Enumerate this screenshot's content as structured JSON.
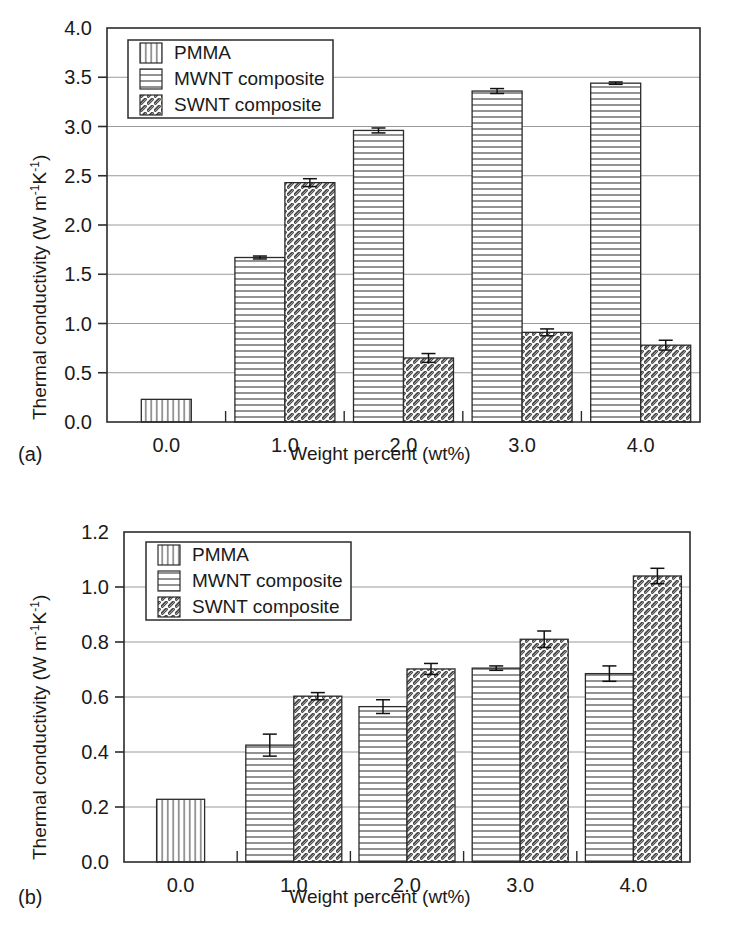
{
  "figure": {
    "panels": [
      {
        "panel_label": "(a)",
        "ylabel_prefix": "Thermal conductivity (W m",
        "ylabel_sup1": "-1",
        "ylabel_mid": "K",
        "ylabel_sup2": "-1",
        "ylabel_suffix": ")",
        "xlabel": "Weight percent (wt%)"
      },
      {
        "panel_label": "(b)",
        "ylabel_prefix": "Thermal conductivity (W m",
        "ylabel_sup1": "-1",
        "ylabel_mid": "K",
        "ylabel_sup2": "-1",
        "ylabel_suffix": ")",
        "xlabel": "Weight percent (wt%)"
      }
    ]
  },
  "chart_data": [
    {
      "type": "bar",
      "panel": "(a)",
      "title": "",
      "xlabel": "Weight percent (wt%)",
      "ylabel": "Thermal conductivity (W m^-1 K^-1)",
      "categories": [
        "0.0",
        "1.0",
        "2.0",
        "3.0",
        "4.0"
      ],
      "xtick_labels": [
        "0.0",
        "1.0",
        "2.0",
        "3.0",
        "4.0"
      ],
      "ytick_labels": [
        "0.0",
        "0.5",
        "1.0",
        "1.5",
        "2.0",
        "2.5",
        "3.0",
        "3.5",
        "4.0"
      ],
      "ylim": [
        0.0,
        4.0
      ],
      "ytick_step": 0.5,
      "grid": true,
      "legend_position": "upper-left-inside",
      "series": [
        {
          "name": "PMMA",
          "hatch": "vertical",
          "values": [
            0.23,
            null,
            null,
            null,
            null
          ],
          "errors": [
            0,
            null,
            null,
            null,
            null
          ]
        },
        {
          "name": "MWNT composite",
          "hatch": "horizontal",
          "values": [
            null,
            1.67,
            2.96,
            3.36,
            3.44
          ],
          "errors": [
            null,
            0.015,
            0.025,
            0.025,
            0.012
          ]
        },
        {
          "name": "SWNT composite",
          "hatch": "diagonal",
          "values": [
            null,
            2.43,
            0.65,
            0.91,
            0.78
          ],
          "errors": [
            null,
            0.04,
            0.045,
            0.035,
            0.05
          ]
        }
      ]
    },
    {
      "type": "bar",
      "panel": "(b)",
      "title": "",
      "xlabel": "Weight percent (wt%)",
      "ylabel": "Thermal conductivity (W m^-1 K^-1)",
      "categories": [
        "0.0",
        "1.0",
        "2.0",
        "3.0",
        "4.0"
      ],
      "xtick_labels": [
        "0.0",
        "1.0",
        "2.0",
        "3.0",
        "4.0"
      ],
      "ytick_labels": [
        "0.0",
        "0.2",
        "0.4",
        "0.6",
        "0.8",
        "1.0",
        "1.2"
      ],
      "ylim": [
        0.0,
        1.2
      ],
      "ytick_step": 0.2,
      "grid": true,
      "legend_position": "upper-left-inside",
      "series": [
        {
          "name": "PMMA",
          "hatch": "vertical",
          "values": [
            0.228,
            null,
            null,
            null,
            null
          ],
          "errors": [
            0,
            null,
            null,
            null,
            null
          ]
        },
        {
          "name": "MWNT composite",
          "hatch": "horizontal",
          "values": [
            null,
            0.425,
            0.565,
            0.705,
            0.685
          ],
          "errors": [
            null,
            0.04,
            0.025,
            0.008,
            0.028
          ]
        },
        {
          "name": "SWNT composite",
          "hatch": "diagonal",
          "values": [
            null,
            0.603,
            0.702,
            0.81,
            1.04
          ],
          "errors": [
            null,
            0.013,
            0.02,
            0.03,
            0.028
          ]
        }
      ]
    }
  ],
  "legend": {
    "entries": [
      "PMMA",
      "MWNT composite",
      "SWNT composite"
    ]
  },
  "colors": {
    "background": "#ffffff",
    "axis": "#2b2b2b",
    "grid": "#9a9a9a",
    "text": "#1a1a1a",
    "bar_fill": "#ffffff",
    "hatch": "#4a4a4a"
  }
}
